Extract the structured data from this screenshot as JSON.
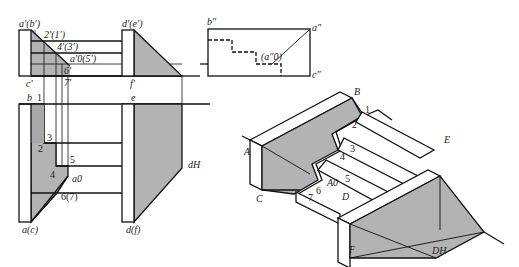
{
  "colors": {
    "shade": "#b3b3b3",
    "line": "#111111",
    "bg": "#ffffff"
  },
  "front_view": {
    "labels": {
      "ab": "a′(b′)",
      "de": "d′(e′)",
      "c": "c′",
      "f": "f′",
      "p21": "2′(1′)",
      "p43": "4′(3′)",
      "a05": "a′0(5′)",
      "p6": "6′",
      "p7": "7′"
    }
  },
  "side_view": {
    "labels": {
      "b": "b″",
      "a": "a″",
      "c": "c″",
      "a0": "(a″0)"
    }
  },
  "plan_view": {
    "labels": {
      "b": "b",
      "p1": "1",
      "p2": "2",
      "p3": "3",
      "p4": "4",
      "p5": "5",
      "a0": "a0",
      "p67": "6(7)",
      "ac": "a(c)",
      "e": "e",
      "df": "d(f)",
      "dH": "dH"
    }
  },
  "axonometric": {
    "labels": {
      "A": "A",
      "B": "B",
      "C": "C",
      "D": "D",
      "E": "E",
      "F": "F",
      "DH": "DH",
      "A0": "A0",
      "p1": "1",
      "p2": "2",
      "p3": "3",
      "p4": "4",
      "p5": "5",
      "p6": "6",
      "p7": "7"
    }
  }
}
